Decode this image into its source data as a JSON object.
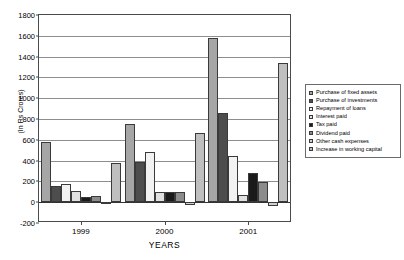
{
  "chart_data": {
    "type": "bar",
    "title": "",
    "xlabel": "YEARS",
    "ylabel": "(In Rs Crores)",
    "categories": [
      "1999",
      "2000",
      "2001"
    ],
    "ylim": [
      -200,
      1800
    ],
    "yticks": [
      1800,
      1600,
      1400,
      1200,
      1000,
      800,
      600,
      400,
      200,
      0,
      -200
    ],
    "grid": true,
    "legend_position": "right",
    "series": [
      {
        "name": "Purchase of fixed assets",
        "values": [
          575,
          750,
          1580
        ]
      },
      {
        "name": "Purchase of investments",
        "values": [
          160,
          390,
          860
        ]
      },
      {
        "name": "Repayment of loans",
        "values": [
          175,
          480,
          440
        ]
      },
      {
        "name": "Interest paid",
        "values": [
          105,
          100,
          70
        ]
      },
      {
        "name": "Tax paid",
        "values": [
          50,
          100,
          285
        ]
      },
      {
        "name": "Dividend paid",
        "values": [
          60,
          95,
          195
        ]
      },
      {
        "name": "Other cash expenses",
        "values": [
          0,
          -30,
          -40
        ]
      },
      {
        "name": "Increase in working capital",
        "values": [
          380,
          670,
          1340
        ]
      }
    ]
  },
  "legend": {
    "items": [
      {
        "label": "Purchase of fixed assets"
      },
      {
        "label": "Purchase of investments"
      },
      {
        "label": "Repayment of loans"
      },
      {
        "label": "Interest paid"
      },
      {
        "label": "Tax paid"
      },
      {
        "label": "Dividend paid"
      },
      {
        "label": "Other cash expenses"
      },
      {
        "label": "Increase in working capital"
      }
    ]
  }
}
